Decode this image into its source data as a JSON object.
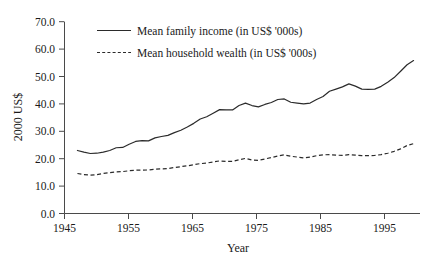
{
  "chart_data": {
    "type": "line",
    "title": "",
    "xlabel": "Year",
    "ylabel": "2000 US$",
    "xlim": [
      1945,
      2000
    ],
    "ylim": [
      0.0,
      70.0
    ],
    "grid": false,
    "legend_position": "upper-left-inside",
    "x_ticks": [
      1945,
      1955,
      1965,
      1975,
      1985,
      1995
    ],
    "x_tick_labels": [
      "1945",
      "1955",
      "1965",
      "1975",
      "1985",
      "1995"
    ],
    "y_ticks": [
      0.0,
      10.0,
      20.0,
      30.0,
      40.0,
      50.0,
      60.0,
      70.0
    ],
    "y_tick_labels": [
      "0.0",
      "10.0",
      "20.0",
      "30.0",
      "40.0",
      "50.0",
      "60.0",
      "70.0"
    ],
    "x": [
      1947,
      1948,
      1949,
      1950,
      1951,
      1952,
      1953,
      1954,
      1955,
      1956,
      1957,
      1958,
      1959,
      1960,
      1961,
      1962,
      1963,
      1964,
      1965,
      1966,
      1967,
      1968,
      1969,
      1970,
      1971,
      1972,
      1973,
      1974,
      1975,
      1976,
      1977,
      1978,
      1979,
      1980,
      1981,
      1982,
      1983,
      1984,
      1985,
      1986,
      1987,
      1988,
      1989,
      1990,
      1991,
      1992,
      1993,
      1994,
      1995,
      1996,
      1997,
      1998,
      1999
    ],
    "series": [
      {
        "name": "Mean family income (in US$ '000s)",
        "style": "solid",
        "values": [
          23.0,
          22.4,
          21.9,
          22.0,
          22.4,
          23.0,
          24.0,
          24.1,
          25.3,
          26.3,
          26.6,
          26.5,
          27.6,
          28.1,
          28.5,
          29.5,
          30.4,
          31.6,
          32.9,
          34.5,
          35.3,
          36.6,
          37.9,
          37.8,
          37.8,
          39.4,
          40.3,
          39.4,
          38.9,
          39.8,
          40.5,
          41.6,
          41.8,
          40.6,
          40.3,
          40.0,
          40.3,
          41.6,
          42.7,
          44.6,
          45.4,
          46.2,
          47.3,
          46.5,
          45.4,
          45.3,
          45.4,
          46.4,
          47.9,
          49.6,
          51.9,
          54.3,
          55.8
        ]
      },
      {
        "name": "Mean household wealth (in US$ '000s)",
        "style": "dashed",
        "values": [
          14.6,
          14.2,
          14.0,
          14.2,
          14.6,
          14.9,
          15.2,
          15.3,
          15.6,
          15.8,
          15.8,
          15.9,
          16.2,
          16.3,
          16.4,
          16.8,
          17.1,
          17.4,
          17.8,
          18.2,
          18.4,
          18.8,
          19.2,
          19.0,
          19.0,
          19.6,
          20.1,
          19.5,
          19.4,
          19.9,
          20.4,
          21.0,
          21.4,
          20.9,
          20.6,
          20.3,
          20.6,
          21.1,
          21.4,
          21.5,
          21.3,
          21.2,
          21.5,
          21.3,
          21.1,
          21.1,
          21.2,
          21.5,
          22.0,
          22.7,
          23.6,
          24.8,
          25.5
        ]
      }
    ],
    "note_right_tail": {
      "comment_not_rendered": false
    }
  },
  "legend": {
    "items": [
      {
        "label": "Mean family income (in US$ '000s)",
        "style": "solid"
      },
      {
        "label": "Mean household wealth (in US$ '000s)",
        "style": "dashed"
      }
    ]
  }
}
